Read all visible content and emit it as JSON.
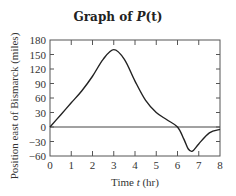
{
  "chart_data": {
    "type": "line",
    "title": "Graph of P(t)",
    "title_main": "Graph of ",
    "title_func": "P",
    "title_arg": "(t)",
    "xlabel": "Time t (hr)",
    "xlabel_pre": "Time ",
    "xlabel_var": "t",
    "xlabel_post": " (hr)",
    "ylabel": "Position east of Bismarck (miles)",
    "xlim": [
      0,
      8
    ],
    "ylim": [
      -60,
      180
    ],
    "xticks": [
      0,
      1,
      2,
      3,
      4,
      5,
      6,
      7,
      8
    ],
    "yticks": [
      180,
      150,
      120,
      90,
      60,
      30,
      0,
      -30,
      -60
    ],
    "grid": false,
    "series": [
      {
        "name": "P(t)",
        "x": [
          0,
          0.5,
          1,
          1.5,
          2,
          2.5,
          3,
          3.5,
          4,
          4.5,
          5,
          5.5,
          6,
          6.3,
          6.5,
          6.7,
          7,
          7.5,
          8
        ],
        "y": [
          0,
          25,
          50,
          75,
          105,
          140,
          160,
          140,
          95,
          55,
          30,
          15,
          0,
          -25,
          -45,
          -50,
          -35,
          -12,
          -5
        ]
      }
    ],
    "reference_line": {
      "y": 0
    }
  }
}
